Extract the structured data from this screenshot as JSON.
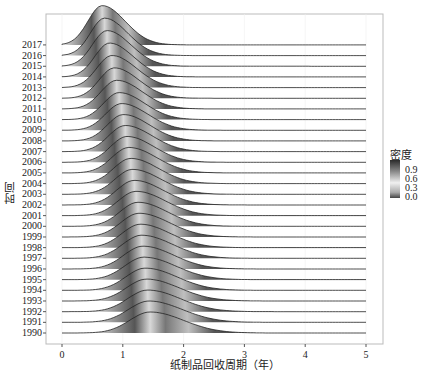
{
  "chart_data": {
    "type": "ridgeline",
    "title": "",
    "xlabel": "纸制品回收周期（年）",
    "ylabel": "时间",
    "x_ticks": [
      0,
      1,
      2,
      3,
      4,
      5
    ],
    "xlim": [
      0,
      5
    ],
    "categories": [
      "1990",
      "1991",
      "1992",
      "1993",
      "1994",
      "1995",
      "1996",
      "1997",
      "1998",
      "1999",
      "2000",
      "2001",
      "2002",
      "2003",
      "2004",
      "2005",
      "2006",
      "2007",
      "2008",
      "2009",
      "2010",
      "2011",
      "2012",
      "2013",
      "2014",
      "2015",
      "2016",
      "2017"
    ],
    "peak_x": [
      1.45,
      1.43,
      1.41,
      1.39,
      1.37,
      1.35,
      1.33,
      1.31,
      1.29,
      1.27,
      1.25,
      1.22,
      1.19,
      1.16,
      1.13,
      1.1,
      1.07,
      1.04,
      1.01,
      0.98,
      0.94,
      0.9,
      0.86,
      0.82,
      0.78,
      0.74,
      0.7,
      0.66
    ],
    "density_sd": [
      0.42,
      0.42,
      0.41,
      0.41,
      0.4,
      0.4,
      0.39,
      0.39,
      0.38,
      0.38,
      0.37,
      0.37,
      0.36,
      0.36,
      0.35,
      0.35,
      0.34,
      0.34,
      0.33,
      0.33,
      0.32,
      0.32,
      0.31,
      0.31,
      0.3,
      0.3,
      0.29,
      0.29
    ],
    "legend": {
      "title": "密度",
      "ticks": [
        "0.9",
        "0.6",
        "0.3",
        "0.0"
      ],
      "position": "right"
    },
    "grid": true
  },
  "labels": {
    "xlabel": "纸制品回收周期（年）",
    "ylabel": "时间",
    "legend_title": "密度",
    "legend_ticks": [
      "0.9",
      "0.6",
      "0.3",
      "0.0"
    ],
    "x_ticks": [
      "0",
      "1",
      "2",
      "3",
      "4",
      "5"
    ]
  }
}
